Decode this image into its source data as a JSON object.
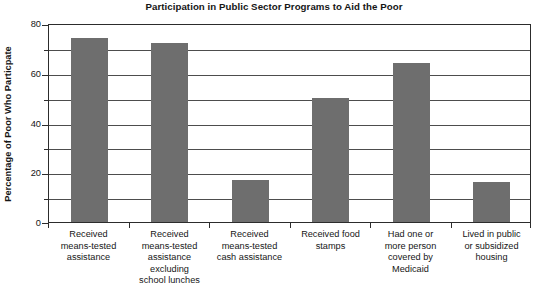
{
  "chart_data": {
    "type": "bar",
    "title": "Participation in Public Sector Programs to Aid the Poor",
    "xlabel": "",
    "ylabel": "Percentage of Poor Who Particpate",
    "categories": [
      "Received means-tested assistance",
      "Received means-tested assistance excluding school lunches",
      "Received means-tested cash assistance",
      "Received food stamps",
      "Had one or more person covered by Medicaid",
      "Lived in public or subsidized housing"
    ],
    "category_lines": [
      [
        "Received",
        "means-tested",
        "assistance"
      ],
      [
        "Received",
        "means-tested",
        "assistance",
        "excluding",
        "school lunches"
      ],
      [
        "Received",
        "means-tested",
        "cash assistance"
      ],
      [
        "Received food",
        "stamps"
      ],
      [
        "Had one or",
        "more person",
        "covered by",
        "Medicaid"
      ],
      [
        "Lived in public",
        "or subsidized",
        "housing"
      ]
    ],
    "values": [
      74,
      72,
      17,
      50,
      64,
      16
    ],
    "ylim": [
      0,
      80
    ],
    "ytick_labels": [
      "0",
      "20",
      "40",
      "60",
      "80"
    ],
    "ytick_values": [
      0,
      20,
      40,
      60,
      80
    ],
    "gridline_values": [
      10,
      20,
      30,
      40,
      50,
      60,
      70
    ],
    "minor_tick_values": [
      10,
      30,
      50,
      70
    ],
    "grid": true,
    "legend": "none",
    "bar_color": "#6e6e6e",
    "axis_color": "#2c2c2c",
    "grid_color": "#4d4d4d",
    "background": "#ffffff"
  }
}
